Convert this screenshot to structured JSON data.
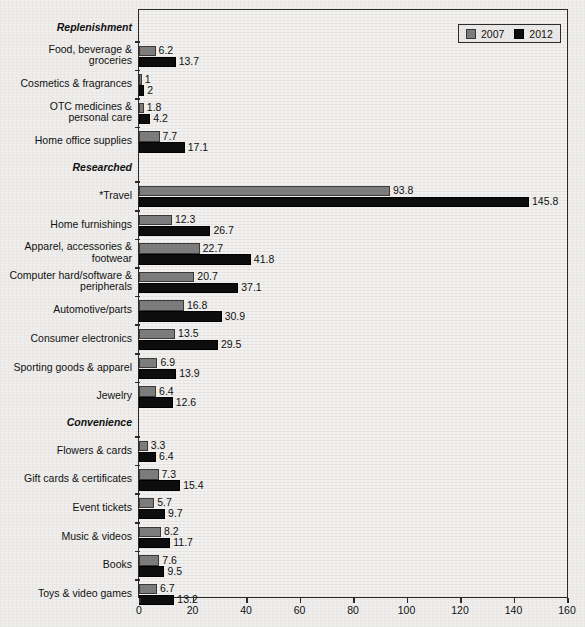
{
  "chart_data": {
    "type": "bar",
    "orientation": "horizontal",
    "title": "",
    "xlabel": "",
    "ylabel": "",
    "xlim": [
      0,
      160
    ],
    "xticks": [
      0,
      20,
      40,
      60,
      80,
      100,
      120,
      140,
      160
    ],
    "grid": false,
    "legend_position": "top-right",
    "legend": [
      "2007",
      "2012"
    ],
    "series": [
      {
        "name": "2007",
        "color": "#7d7d7d",
        "values": [
          6.2,
          1,
          1.8,
          7.7,
          93.8,
          12.3,
          22.7,
          20.7,
          16.8,
          13.5,
          6.9,
          6.4,
          3.3,
          7.3,
          5.7,
          8.2,
          7.6,
          6.7
        ]
      },
      {
        "name": "2012",
        "color": "#0d0d0d",
        "values": [
          13.7,
          2,
          4.2,
          17.1,
          145.8,
          26.7,
          41.8,
          37.1,
          30.9,
          29.5,
          13.9,
          12.6,
          6.4,
          15.4,
          9.7,
          11.7,
          9.5,
          13.2
        ]
      }
    ],
    "categories": [
      "Food, beverage &\ngroceries",
      "Cosmetics & fragrances",
      "OTC medicines &\npersonal care",
      "Home office supplies",
      "*Travel",
      "Home furnishings",
      "Apparel, accessories &\nfootwear",
      "Computer hard/software &\nperipherals",
      "Automotive/parts",
      "Consumer electronics",
      "Sporting goods & apparel",
      "Jewelry",
      "Flowers & cards",
      "Gift cards & certificates",
      "Event tickets",
      "Music & videos",
      "Books",
      "Toys & video games"
    ],
    "group_headers": [
      {
        "label": "Replenishment",
        "before_category": "Food, beverage &\ngroceries"
      },
      {
        "label": "Researched",
        "before_category": "*Travel"
      },
      {
        "label": "Convenience",
        "before_category": "Flowers & cards"
      }
    ]
  },
  "rows": [
    {
      "group": "Replenishment",
      "label": "Food, beverage &\ngroceries",
      "v2007": 6.2,
      "v2012": 13.7,
      "t2007": "6.2",
      "t2012": "13.7"
    },
    {
      "group": "Replenishment",
      "label": "Cosmetics & fragrances",
      "v2007": 1,
      "v2012": 2,
      "t2007": "1",
      "t2012": "2"
    },
    {
      "group": "Replenishment",
      "label": "OTC medicines &\npersonal care",
      "v2007": 1.8,
      "v2012": 4.2,
      "t2007": "1.8",
      "t2012": "4.2"
    },
    {
      "group": "Replenishment",
      "label": "Home office supplies",
      "v2007": 7.7,
      "v2012": 17.1,
      "t2007": "7.7",
      "t2012": "17.1"
    },
    {
      "group": "Researched",
      "label": "*Travel",
      "v2007": 93.8,
      "v2012": 145.8,
      "t2007": "93.8",
      "t2012": "145.8"
    },
    {
      "group": "Researched",
      "label": "Home furnishings",
      "v2007": 12.3,
      "v2012": 26.7,
      "t2007": "12.3",
      "t2012": "26.7"
    },
    {
      "group": "Researched",
      "label": "Apparel, accessories &\nfootwear",
      "v2007": 22.7,
      "v2012": 41.8,
      "t2007": "22.7",
      "t2012": "41.8"
    },
    {
      "group": "Researched",
      "label": "Computer hard/software &\nperipherals",
      "v2007": 20.7,
      "v2012": 37.1,
      "t2007": "20.7",
      "t2012": "37.1"
    },
    {
      "group": "Researched",
      "label": "Automotive/parts",
      "v2007": 16.8,
      "v2012": 30.9,
      "t2007": "16.8",
      "t2012": "30.9"
    },
    {
      "group": "Researched",
      "label": "Consumer electronics",
      "v2007": 13.5,
      "v2012": 29.5,
      "t2007": "13.5",
      "t2012": "29.5"
    },
    {
      "group": "Researched",
      "label": "Sporting goods & apparel",
      "v2007": 6.9,
      "v2012": 13.9,
      "t2007": "6.9",
      "t2012": "13.9"
    },
    {
      "group": "Researched",
      "label": "Jewelry",
      "v2007": 6.4,
      "v2012": 12.6,
      "t2007": "6.4",
      "t2012": "12.6"
    },
    {
      "group": "Convenience",
      "label": "Flowers & cards",
      "v2007": 3.3,
      "v2012": 6.4,
      "t2007": "3.3",
      "t2012": "6.4"
    },
    {
      "group": "Convenience",
      "label": "Gift cards & certificates",
      "v2007": 7.3,
      "v2012": 15.4,
      "t2007": "7.3",
      "t2012": "15.4"
    },
    {
      "group": "Convenience",
      "label": "Event tickets",
      "v2007": 5.7,
      "v2012": 9.7,
      "t2007": "5.7",
      "t2012": "9.7"
    },
    {
      "group": "Convenience",
      "label": "Music & videos",
      "v2007": 8.2,
      "v2012": 11.7,
      "t2007": "8.2",
      "t2012": "11.7"
    },
    {
      "group": "Convenience",
      "label": "Books",
      "v2007": 7.6,
      "v2012": 9.5,
      "t2007": "7.6",
      "t2012": "9.5"
    },
    {
      "group": "Convenience",
      "label": "Toys & video games",
      "v2007": 6.7,
      "v2012": 13.2,
      "t2007": "6.7",
      "t2012": "13.2"
    }
  ],
  "group_headers": [
    "Replenishment",
    "Researched",
    "Convenience"
  ],
  "legend": {
    "items": [
      {
        "label": "2007",
        "color": "#7d7d7d"
      },
      {
        "label": "2012",
        "color": "#0d0d0d"
      }
    ]
  },
  "axis": {
    "x_ticks": [
      "0",
      "20",
      "40",
      "60",
      "80",
      "100",
      "120",
      "140",
      "160"
    ],
    "x_min": 0,
    "x_max": 160
  },
  "colors": {
    "series_2007": "#7d7d7d",
    "series_2012": "#0d0d0d",
    "page_background": "#efeeec",
    "plot_background": "#f4f3f1",
    "frame": "#2b2b2b"
  }
}
